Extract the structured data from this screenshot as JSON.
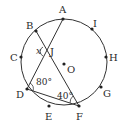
{
  "diagram": {
    "type": "circle-geometry",
    "circle": {
      "center_label": "O",
      "cx": 64,
      "cy": 62,
      "r": 43
    },
    "points": [
      {
        "label": "A",
        "x": 63,
        "y": 19,
        "lx": 59,
        "ly": 13
      },
      {
        "label": "I",
        "x": 92,
        "y": 29,
        "lx": 93,
        "ly": 27
      },
      {
        "label": "H",
        "x": 106,
        "y": 57,
        "lx": 109,
        "ly": 61
      },
      {
        "label": "G",
        "x": 101,
        "y": 87,
        "lx": 103,
        "ly": 97
      },
      {
        "label": "F",
        "x": 79,
        "y": 106,
        "lx": 76,
        "ly": 120
      },
      {
        "label": "E",
        "x": 49,
        "y": 106,
        "lx": 45,
        "ly": 120
      },
      {
        "label": "D",
        "x": 27,
        "y": 89,
        "lx": 16,
        "ly": 98
      },
      {
        "label": "C",
        "x": 21,
        "y": 57,
        "lx": 10,
        "ly": 61
      },
      {
        "label": "B",
        "x": 36,
        "y": 31,
        "lx": 26,
        "ly": 29
      }
    ],
    "intersection": {
      "label": "J",
      "x": 46,
      "y": 51,
      "lx": 50,
      "ly": 55
    },
    "center_point": {
      "label": "O",
      "x": 64,
      "y": 64,
      "lx": 67,
      "ly": 73
    },
    "segments": [
      {
        "from": "A",
        "to": "D"
      },
      {
        "from": "B",
        "to": "F"
      },
      {
        "from": "D",
        "to": "F"
      }
    ],
    "angles": [
      {
        "vertex": "J",
        "label": "x",
        "value": "x",
        "lx": 36,
        "ly": 54
      },
      {
        "vertex": "D",
        "label": "80°",
        "value": 80,
        "lx": 36,
        "ly": 85
      },
      {
        "vertex": "F",
        "label": "40°",
        "value": 40,
        "lx": 57,
        "ly": 99
      }
    ]
  }
}
